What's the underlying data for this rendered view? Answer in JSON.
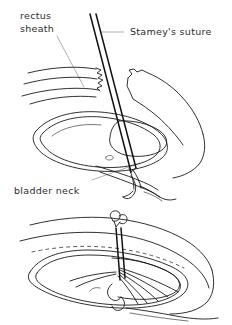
{
  "figure": {
    "background_color": "#ffffff",
    "ink_color": "#1a1a1a",
    "leader_color": "#9a9a9a",
    "panels": [
      {
        "name": "upper-panel",
        "description": "Sagittal view of needle carrying Stamey's suture through the rectus sheath down to the bladder neck"
      },
      {
        "name": "lower-panel",
        "description": "Suture tied over the rectus sheath, strands fanning down to the bladder neck"
      }
    ]
  },
  "labels": {
    "rectus_sheath": {
      "line1": "rectus",
      "line2": "sheath"
    },
    "stameys_suture": "Stamey's suture",
    "bladder_neck": "bladder neck"
  }
}
